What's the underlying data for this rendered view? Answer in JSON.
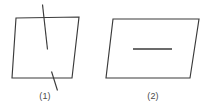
{
  "figure": {
    "background_color": "#ffffff",
    "stroke_color": "#3a3a3a",
    "caption_color": "#4a4a4a",
    "panels": [
      {
        "id": "panel-1",
        "caption": "(1)",
        "caption_x": 45,
        "caption_y": 99,
        "shape": {
          "name": "parallelogram",
          "points": "16,18 79,17 72,78 12,78"
        },
        "marks": [
          {
            "name": "top-crossing-slanted-line",
            "x1": 42.5,
            "y1": 4.5,
            "x2": 47.5,
            "y2": 49.5
          },
          {
            "name": "bottom-crossing-slanted-line",
            "x1": 51.5,
            "y1": 71.5,
            "x2": 57.5,
            "y2": 90.5
          }
        ]
      },
      {
        "id": "panel-2",
        "caption": "(2)",
        "caption_x": 153,
        "caption_y": 99,
        "shape": {
          "name": "parallelogram",
          "points": "113,19 199,19 190,78 106,78"
        },
        "marks": [
          {
            "name": "interior-horizontal-line",
            "x1": 133,
            "y1": 49,
            "x2": 172,
            "y2": 49
          }
        ]
      }
    ]
  }
}
